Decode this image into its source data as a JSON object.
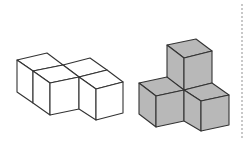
{
  "figures": [
    {
      "id": "left",
      "description": "Four unit cubes in an L/step arrangement, outline only",
      "cube_count": 4,
      "fill": "#ffffff",
      "stroke": "#333333"
    },
    {
      "id": "right",
      "description": "Four unit cubes arranged as a corner (three around one stacked), shaded gray",
      "cube_count": 4,
      "fill": "#b8b8b8",
      "stroke": "#333333"
    }
  ],
  "colors": {
    "background": "#ffffff",
    "line": "#333333",
    "shade": "#b8b8b8",
    "divider": "#c8c8c8"
  }
}
